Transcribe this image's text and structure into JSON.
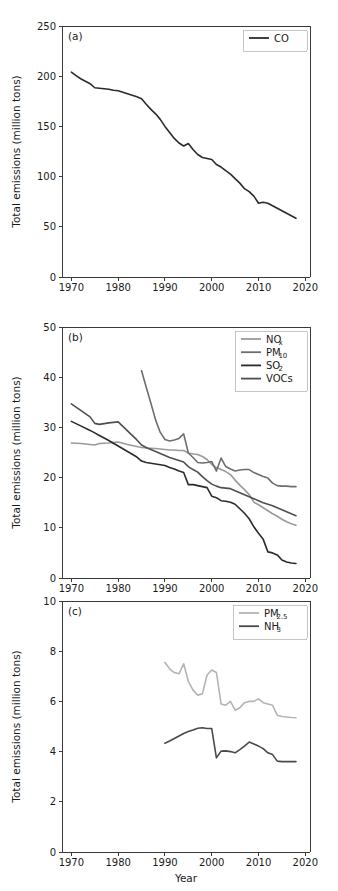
{
  "figure": {
    "xlabel": "Year",
    "ylabel": "Total emissions (million tons)",
    "xticks": [
      "1970",
      "1980",
      "1990",
      "2000",
      "2010",
      "2020"
    ],
    "xlim": [
      1968,
      2021
    ]
  },
  "colors": {
    "co": "#2b2b2b",
    "nox": "#9a9a9a",
    "pm10": "#6e6e6e",
    "so2": "#2b2b2b",
    "vocs": "#4f4f4f",
    "pm25": "#b4b4b4",
    "nh3": "#4a4a4a",
    "axis": "#3a3a3a",
    "text": "#1a1a1a",
    "legend_border": "#b8b8b8"
  },
  "chart_data": [
    {
      "type": "line",
      "panel_label": "(a)",
      "title": "",
      "xlabel": "",
      "ylabel": "Total emissions (million tons)",
      "xlim": [
        1968,
        2021
      ],
      "ylim": [
        0,
        250
      ],
      "yticks": [
        0,
        50,
        100,
        150,
        200,
        250
      ],
      "xticks": [
        1970,
        1980,
        1990,
        2000,
        2010,
        2020
      ],
      "grid": false,
      "legend_position": "top-right",
      "series": [
        {
          "name": "CO",
          "color": "#2b2b2b",
          "x": [
            1970,
            1971,
            1972,
            1973,
            1974,
            1975,
            1976,
            1977,
            1978,
            1979,
            1980,
            1981,
            1982,
            1983,
            1984,
            1985,
            1986,
            1987,
            1988,
            1989,
            1990,
            1991,
            1992,
            1993,
            1994,
            1995,
            1996,
            1997,
            1998,
            1999,
            2000,
            2001,
            2002,
            2003,
            2004,
            2005,
            2006,
            2007,
            2008,
            2009,
            2010,
            2011,
            2012,
            2013,
            2014,
            2015,
            2016,
            2017,
            2018
          ],
          "values": [
            204.0,
            200.5,
            197.5,
            195.0,
            192.5,
            188.5,
            188.0,
            187.5,
            187.0,
            186.0,
            185.5,
            184.0,
            182.5,
            181.0,
            179.5,
            177.5,
            172.0,
            167.0,
            162.5,
            157.0,
            150.0,
            144.0,
            138.0,
            133.5,
            130.5,
            133.0,
            127.0,
            122.0,
            119.0,
            118.0,
            117.0,
            112.0,
            109.5,
            106.0,
            102.5,
            98.0,
            93.5,
            88.0,
            85.0,
            80.5,
            73.5,
            74.5,
            73.5,
            71.0,
            68.5,
            66.0,
            63.5,
            61.0,
            58.5
          ]
        }
      ]
    },
    {
      "type": "line",
      "panel_label": "(b)",
      "title": "",
      "xlabel": "",
      "ylabel": "Total emissions (million tons)",
      "xlim": [
        1968,
        2021
      ],
      "ylim": [
        0,
        50
      ],
      "yticks": [
        0,
        10,
        20,
        30,
        40,
        50
      ],
      "xticks": [
        1970,
        1980,
        1990,
        2000,
        2010,
        2020
      ],
      "grid": false,
      "legend_position": "top-right",
      "series": [
        {
          "name": "NOx",
          "label_main": "NO",
          "label_sub": "x",
          "color": "#9a9a9a",
          "x": [
            1970,
            1972,
            1974,
            1975,
            1976,
            1978,
            1980,
            1982,
            1984,
            1985,
            1986,
            1988,
            1990,
            1991,
            1992,
            1993,
            1994,
            1995,
            1996,
            1997,
            1998,
            1999,
            2000,
            2001,
            2002,
            2003,
            2004,
            2005,
            2006,
            2007,
            2008,
            2009,
            2010,
            2011,
            2012,
            2013,
            2014,
            2015,
            2016,
            2017,
            2018
          ],
          "values": [
            26.9,
            26.8,
            26.6,
            26.5,
            26.8,
            26.9,
            27.1,
            26.6,
            26.2,
            26.0,
            25.9,
            25.8,
            25.6,
            25.5,
            25.5,
            25.4,
            25.4,
            24.9,
            24.7,
            24.6,
            24.2,
            23.6,
            22.6,
            22.0,
            21.6,
            21.2,
            20.6,
            19.5,
            18.5,
            17.6,
            16.6,
            15.1,
            14.6,
            14.0,
            13.4,
            12.8,
            12.3,
            11.7,
            11.2,
            10.8,
            10.5
          ]
        },
        {
          "name": "PM10",
          "label_main": "PM",
          "label_sub": "10",
          "color": "#6e6e6e",
          "x": [
            1985,
            1986,
            1987,
            1988,
            1989,
            1990,
            1991,
            1992,
            1993,
            1994,
            1995,
            1996,
            1997,
            1998,
            1999,
            2000,
            2001,
            2002,
            2003,
            2004,
            2005,
            2006,
            2007,
            2008,
            2009,
            2010,
            2011,
            2012,
            2013,
            2014,
            2015,
            2016,
            2017,
            2018
          ],
          "values": [
            41.3,
            38.0,
            34.8,
            31.5,
            29.0,
            27.6,
            27.3,
            27.5,
            27.8,
            28.7,
            24.9,
            24.0,
            23.0,
            22.9,
            23.0,
            23.2,
            21.3,
            23.9,
            22.2,
            21.7,
            21.3,
            21.5,
            21.6,
            21.6,
            21.0,
            20.6,
            20.2,
            19.9,
            18.9,
            18.4,
            18.3,
            18.3,
            18.2,
            18.2
          ]
        },
        {
          "name": "SO2",
          "label_main": "SO",
          "label_sub": "2",
          "color": "#2b2b2b",
          "x": [
            1970,
            1972,
            1974,
            1975,
            1976,
            1978,
            1980,
            1982,
            1984,
            1985,
            1986,
            1988,
            1990,
            1991,
            1992,
            1993,
            1994,
            1995,
            1996,
            1997,
            1998,
            1999,
            2000,
            2001,
            2002,
            2003,
            2004,
            2005,
            2006,
            2007,
            2008,
            2009,
            2010,
            2011,
            2012,
            2013,
            2014,
            2015,
            2016,
            2017,
            2018
          ],
          "values": [
            31.2,
            30.3,
            29.4,
            28.9,
            28.4,
            27.4,
            26.3,
            25.2,
            24.1,
            23.3,
            23.0,
            22.7,
            22.4,
            22.0,
            21.7,
            21.3,
            21.0,
            18.6,
            18.6,
            18.4,
            18.2,
            18.0,
            16.3,
            16.0,
            15.4,
            15.3,
            15.1,
            14.7,
            13.8,
            12.9,
            11.8,
            10.2,
            8.9,
            7.7,
            5.2,
            5.0,
            4.6,
            3.6,
            3.2,
            3.0,
            2.9
          ]
        },
        {
          "name": "VOCs",
          "label_main": "VOCs",
          "label_sub": "",
          "color": "#4f4f4f",
          "x": [
            1970,
            1972,
            1974,
            1975,
            1976,
            1978,
            1980,
            1982,
            1984,
            1985,
            1986,
            1988,
            1990,
            1991,
            1992,
            1993,
            1994,
            1995,
            1996,
            1997,
            1998,
            1999,
            2000,
            2001,
            2002,
            2003,
            2004,
            2005,
            2006,
            2007,
            2008,
            2009,
            2010,
            2011,
            2012,
            2013,
            2014,
            2015,
            2016,
            2017,
            2018
          ],
          "values": [
            34.7,
            33.4,
            32.1,
            30.8,
            30.6,
            30.9,
            31.1,
            29.3,
            27.5,
            26.5,
            26.0,
            25.2,
            24.4,
            24.0,
            23.7,
            23.4,
            23.1,
            22.2,
            21.6,
            21.1,
            20.2,
            19.4,
            18.7,
            18.3,
            18.0,
            17.9,
            17.8,
            17.4,
            17.0,
            16.6,
            16.2,
            15.8,
            15.4,
            15.0,
            14.7,
            14.4,
            14.0,
            13.6,
            13.2,
            12.8,
            12.4
          ]
        }
      ]
    },
    {
      "type": "line",
      "panel_label": "(c)",
      "title": "",
      "xlabel": "Year",
      "ylabel": "Total emissions (million tons)",
      "xlim": [
        1968,
        2021
      ],
      "ylim": [
        0,
        10
      ],
      "yticks": [
        0,
        2,
        4,
        6,
        8,
        10
      ],
      "xticks": [
        1970,
        1980,
        1990,
        2000,
        2010,
        2020
      ],
      "grid": false,
      "legend_position": "top-right",
      "series": [
        {
          "name": "PM2.5",
          "label_main": "PM",
          "label_sub": "2.5",
          "color": "#b4b4b4",
          "x": [
            1990,
            1991,
            1992,
            1993,
            1994,
            1995,
            1996,
            1997,
            1998,
            1999,
            2000,
            2001,
            2002,
            2003,
            2004,
            2005,
            2006,
            2007,
            2008,
            2009,
            2010,
            2011,
            2012,
            2013,
            2014,
            2015,
            2016,
            2017,
            2018
          ],
          "values": [
            7.55,
            7.3,
            7.15,
            7.1,
            7.5,
            6.8,
            6.45,
            6.25,
            6.3,
            7.05,
            7.25,
            7.15,
            5.9,
            5.85,
            6.0,
            5.65,
            5.75,
            5.95,
            6.0,
            6.0,
            6.1,
            5.95,
            5.9,
            5.85,
            5.45,
            5.4,
            5.38,
            5.36,
            5.35
          ]
        },
        {
          "name": "NH3",
          "label_main": "NH",
          "label_sub": "3",
          "color": "#4a4a4a",
          "x": [
            1990,
            1991,
            1992,
            1993,
            1994,
            1995,
            1996,
            1997,
            1998,
            1999,
            2000,
            2001,
            2002,
            2003,
            2004,
            2005,
            2006,
            2007,
            2008,
            2009,
            2010,
            2011,
            2012,
            2013,
            2014,
            2015,
            2016,
            2017,
            2018
          ],
          "values": [
            4.33,
            4.42,
            4.52,
            4.62,
            4.72,
            4.8,
            4.86,
            4.93,
            4.95,
            4.92,
            4.92,
            3.75,
            4.02,
            4.03,
            4.0,
            3.95,
            4.08,
            4.22,
            4.38,
            4.3,
            4.22,
            4.12,
            3.95,
            3.88,
            3.62,
            3.6,
            3.6,
            3.6,
            3.6
          ]
        }
      ]
    }
  ]
}
